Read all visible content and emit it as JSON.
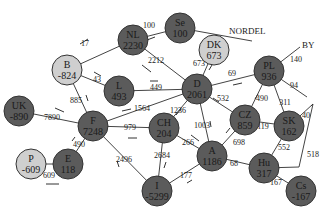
{
  "diagram": {
    "type": "network",
    "title": "",
    "regions": [
      {
        "id": "nordel",
        "label": "NORDEL"
      },
      {
        "id": "by",
        "label": "BY"
      }
    ],
    "colors": {
      "dark": "#5b5b5b",
      "light": "#cfcfcf",
      "edge": "#444444",
      "text": "#222222"
    },
    "nodes": [
      {
        "id": "NL",
        "label": "NL",
        "value": "2230",
        "x": 133,
        "y": 40,
        "shade": "dark"
      },
      {
        "id": "Se",
        "label": "Se",
        "value": "100",
        "x": 180,
        "y": 28,
        "shade": "dark"
      },
      {
        "id": "DK",
        "label": "DK",
        "value": "673",
        "x": 214,
        "y": 50,
        "shade": "light"
      },
      {
        "id": "B",
        "label": "B",
        "value": "-824",
        "x": 67,
        "y": 70,
        "shade": "light"
      },
      {
        "id": "L",
        "label": "L",
        "value": "493",
        "x": 119,
        "y": 91,
        "shade": "dark"
      },
      {
        "id": "D",
        "label": "D",
        "value": "2061",
        "x": 197,
        "y": 89,
        "shade": "dark"
      },
      {
        "id": "PL",
        "label": "PL",
        "value": "936",
        "x": 269,
        "y": 71,
        "shade": "dark"
      },
      {
        "id": "UK",
        "label": "UK",
        "value": "-890",
        "x": 19,
        "y": 111,
        "shade": "dark"
      },
      {
        "id": "F",
        "label": "F",
        "value": "7248",
        "x": 93,
        "y": 126,
        "shade": "dark"
      },
      {
        "id": "CH",
        "label": "CH",
        "value": "204",
        "x": 164,
        "y": 128,
        "shade": "dark"
      },
      {
        "id": "CZ",
        "label": "CZ",
        "value": "859",
        "x": 245,
        "y": 120,
        "shade": "dark"
      },
      {
        "id": "SK",
        "label": "SK",
        "value": "162",
        "x": 289,
        "y": 126,
        "shade": "dark"
      },
      {
        "id": "A",
        "label": "A",
        "value": "1186",
        "x": 212,
        "y": 156,
        "shade": "dark"
      },
      {
        "id": "P",
        "label": "P",
        "value": "-609",
        "x": 31,
        "y": 164,
        "shade": "light"
      },
      {
        "id": "E",
        "label": "E",
        "value": "118",
        "x": 68,
        "y": 164,
        "shade": "dark"
      },
      {
        "id": "Hu",
        "label": "Hu",
        "value": "317",
        "x": 264,
        "y": 168,
        "shade": "dark"
      },
      {
        "id": "I",
        "label": "I",
        "value": "-5299",
        "x": 157,
        "y": 191,
        "shade": "dark"
      },
      {
        "id": "Cs",
        "label": "Cs",
        "value": "-167",
        "x": 301,
        "y": 191,
        "shade": "dark"
      }
    ],
    "edges": [
      {
        "from": "B",
        "to": "NL",
        "flow": "17",
        "lx": 85,
        "ly": 46
      },
      {
        "from": "NL",
        "to": "Se",
        "flow": "100",
        "lx": 149,
        "ly": 28
      },
      {
        "from": "NL",
        "to": "D",
        "flow": "2212",
        "lx": 156,
        "ly": 63
      },
      {
        "from": "B",
        "to": "L",
        "flow": "43",
        "lx": 97,
        "ly": 82
      },
      {
        "from": "L",
        "to": "D",
        "flow": "449",
        "lx": 156,
        "ly": 90
      },
      {
        "from": "B",
        "to": "F",
        "flow": "885",
        "lx": 76,
        "ly": 103
      },
      {
        "from": "UK",
        "to": "F",
        "flow": "7890",
        "lx": 52,
        "ly": 120
      },
      {
        "from": "F",
        "to": "D",
        "flow": "1564",
        "lx": 142,
        "ly": 111
      },
      {
        "from": "F",
        "to": "CH",
        "flow": "979",
        "lx": 130,
        "ly": 130
      },
      {
        "from": "F",
        "to": "E",
        "flow": "490",
        "lx": 79,
        "ly": 147
      },
      {
        "from": "P",
        "to": "E",
        "flow": "609",
        "lx": 49,
        "ly": 178
      },
      {
        "from": "F",
        "to": "I",
        "flow": "2496",
        "lx": 124,
        "ly": 162
      },
      {
        "from": "CH",
        "to": "I",
        "flow": "2684",
        "lx": 162,
        "ly": 158
      },
      {
        "from": "D",
        "to": "CH",
        "flow": "1236",
        "lx": 178,
        "ly": 113
      },
      {
        "from": "D",
        "to": "A",
        "flow": "1003",
        "lx": 202,
        "ly": 128
      },
      {
        "from": "CH",
        "to": "A",
        "flow": "266",
        "lx": 188,
        "ly": 145
      },
      {
        "from": "A",
        "to": "I",
        "flow": "177",
        "lx": 186,
        "ly": 178
      },
      {
        "from": "DK",
        "to": "D",
        "flow": "673",
        "lx": 199,
        "ly": 66
      },
      {
        "from": "Se",
        "to": "NORDEL",
        "flow": "",
        "lx": 0,
        "ly": 0
      },
      {
        "from": "PL",
        "to": "D",
        "flow": "69",
        "lx": 232,
        "ly": 76
      },
      {
        "from": "D",
        "to": "CZ",
        "flow": "532",
        "lx": 223,
        "ly": 101
      },
      {
        "from": "PL",
        "to": "CZ",
        "flow": "490",
        "lx": 262,
        "ly": 101
      },
      {
        "from": "PL",
        "to": "SK",
        "flow": "311",
        "lx": 285,
        "ly": 105
      },
      {
        "from": "BY",
        "to": "PL",
        "flow": "140",
        "lx": 296,
        "ly": 62
      },
      {
        "from": "PL",
        "to": "ext",
        "flow": "94",
        "lx": 294,
        "ly": 88
      },
      {
        "from": "CZ",
        "to": "SK",
        "flow": "119",
        "lx": 263,
        "ly": 129
      },
      {
        "from": "CZ",
        "to": "A",
        "flow": "698",
        "lx": 239,
        "ly": 145
      },
      {
        "from": "SK",
        "to": "Hu",
        "flow": "552",
        "lx": 284,
        "ly": 150
      },
      {
        "from": "ext",
        "to": "SK",
        "flow": "40",
        "lx": 306,
        "ly": 118
      },
      {
        "from": "ext",
        "to": "Hu",
        "flow": "518",
        "lx": 313,
        "ly": 157
      },
      {
        "from": "Hu",
        "to": "A",
        "flow": "68",
        "lx": 234,
        "ly": 166
      },
      {
        "from": "Hu",
        "to": "Cs",
        "flow": "167",
        "lx": 276,
        "ly": 185
      }
    ]
  }
}
